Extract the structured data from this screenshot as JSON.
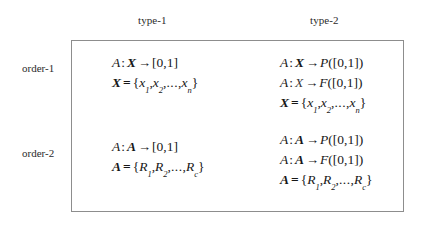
{
  "figure": {
    "type": "matrix-table",
    "columns": [
      {
        "id": "type-1",
        "label": "type-1"
      },
      {
        "id": "type-2",
        "label": "type-2"
      }
    ],
    "rows": [
      {
        "id": "order-1",
        "label": "order-1"
      },
      {
        "id": "order-2",
        "label": "order-2"
      }
    ],
    "border_color": "#8d8d8d",
    "text_color": "#171717",
    "background": "#ffffff"
  },
  "symbols": {
    "colon": ":",
    "arrow": "→",
    "equals": "=",
    "open_brace": "{",
    "close_brace": "}",
    "ellipsis": "...",
    "comma": ",",
    "unit_interval": "[0,1]"
  },
  "cells": {
    "type1_order1": {
      "lines": [
        {
          "id": "map-A-X-unit",
          "text": "A : X → [0,1]",
          "parts": [
            {
              "kind": "var-italic",
              "text": "A"
            },
            {
              "kind": "colon",
              "text": ":"
            },
            {
              "kind": "var-bold-italic",
              "text": "X"
            },
            {
              "kind": "arrow",
              "text": "→"
            },
            {
              "kind": "roman",
              "text": "[0,1]"
            }
          ]
        },
        {
          "id": "set-X",
          "text": "X = {x1, x2, ..., xn}",
          "parts": [
            {
              "kind": "var-bold-italic",
              "text": "X"
            },
            {
              "kind": "equals",
              "text": "="
            },
            {
              "kind": "brace",
              "text": "{"
            },
            {
              "kind": "var-italic-sub",
              "text": "x",
              "sub": "1"
            },
            {
              "kind": "comma",
              "text": ","
            },
            {
              "kind": "var-italic-sub",
              "text": "x",
              "sub": "2"
            },
            {
              "kind": "comma",
              "text": ","
            },
            {
              "kind": "dots",
              "text": "..."
            },
            {
              "kind": "comma",
              "text": ","
            },
            {
              "kind": "var-italic-sub",
              "text": "x",
              "sub": "n"
            },
            {
              "kind": "brace",
              "text": "}"
            }
          ]
        }
      ]
    },
    "type2_order1": {
      "lines": [
        {
          "id": "map-A-X-P-unit",
          "text": "A : X → P([0,1])",
          "parts": [
            {
              "kind": "var-italic",
              "text": "A"
            },
            {
              "kind": "colon",
              "text": ":"
            },
            {
              "kind": "var-bold-italic",
              "text": "X"
            },
            {
              "kind": "arrow",
              "text": "→"
            },
            {
              "kind": "var-italic",
              "text": "P"
            },
            {
              "kind": "roman",
              "text": "([0,1])"
            }
          ]
        },
        {
          "id": "map-A-X-F-unit",
          "text": "A : X → F([0,1])",
          "parts": [
            {
              "kind": "var-italic",
              "text": "A"
            },
            {
              "kind": "colon",
              "text": ":"
            },
            {
              "kind": "var-italic-light",
              "text": "X"
            },
            {
              "kind": "arrow",
              "text": "→"
            },
            {
              "kind": "var-italic",
              "text": "F"
            },
            {
              "kind": "roman",
              "text": "([0,1])"
            }
          ]
        },
        {
          "id": "set-X",
          "text": "X = {x1, x2, ..., xn}",
          "parts": [
            {
              "kind": "var-bold-italic",
              "text": "X"
            },
            {
              "kind": "equals",
              "text": "="
            },
            {
              "kind": "brace",
              "text": "{"
            },
            {
              "kind": "var-italic-sub",
              "text": "x",
              "sub": "1"
            },
            {
              "kind": "comma",
              "text": ","
            },
            {
              "kind": "var-italic-sub",
              "text": "x",
              "sub": "2"
            },
            {
              "kind": "comma",
              "text": ","
            },
            {
              "kind": "dots",
              "text": "..."
            },
            {
              "kind": "comma",
              "text": ","
            },
            {
              "kind": "var-italic-sub",
              "text": "x",
              "sub": "n"
            },
            {
              "kind": "brace",
              "text": "}"
            }
          ]
        }
      ]
    },
    "type1_order2": {
      "lines": [
        {
          "id": "map-A-A-unit",
          "text": "A : A → [0,1]",
          "parts": [
            {
              "kind": "var-italic",
              "text": "A"
            },
            {
              "kind": "colon",
              "text": ":"
            },
            {
              "kind": "var-bold-italic",
              "text": "A"
            },
            {
              "kind": "arrow",
              "text": "→"
            },
            {
              "kind": "roman",
              "text": "[0,1]"
            }
          ]
        },
        {
          "id": "set-A",
          "text": "A = {R1, R2, ..., Rc}",
          "parts": [
            {
              "kind": "var-bold-italic",
              "text": "A"
            },
            {
              "kind": "equals",
              "text": "="
            },
            {
              "kind": "brace",
              "text": "{"
            },
            {
              "kind": "var-italic-sub",
              "text": "R",
              "sub": "1"
            },
            {
              "kind": "comma",
              "text": ","
            },
            {
              "kind": "var-italic-sub",
              "text": "R",
              "sub": "2"
            },
            {
              "kind": "comma",
              "text": ","
            },
            {
              "kind": "dots",
              "text": "..."
            },
            {
              "kind": "comma",
              "text": ","
            },
            {
              "kind": "var-italic-sub",
              "text": "R",
              "sub": "c"
            },
            {
              "kind": "brace",
              "text": "}"
            }
          ]
        }
      ]
    },
    "type2_order2": {
      "lines": [
        {
          "id": "map-A-A-P-unit",
          "text": "A : A → P([0,1])",
          "parts": [
            {
              "kind": "var-italic",
              "text": "A"
            },
            {
              "kind": "colon",
              "text": ":"
            },
            {
              "kind": "var-bold-italic",
              "text": "A"
            },
            {
              "kind": "arrow",
              "text": "→"
            },
            {
              "kind": "var-italic",
              "text": "P"
            },
            {
              "kind": "roman",
              "text": "([0,1])"
            }
          ]
        },
        {
          "id": "map-A-A-F-unit",
          "text": "A : A → F([0,1])",
          "parts": [
            {
              "kind": "var-italic",
              "text": "A"
            },
            {
              "kind": "colon",
              "text": ":"
            },
            {
              "kind": "var-bold-italic",
              "text": "A"
            },
            {
              "kind": "arrow",
              "text": "→"
            },
            {
              "kind": "var-italic",
              "text": "F"
            },
            {
              "kind": "roman",
              "text": "([0,1])"
            }
          ]
        },
        {
          "id": "set-A",
          "text": "A = {R1, R2, ..., Rc}",
          "parts": [
            {
              "kind": "var-bold-italic",
              "text": "A"
            },
            {
              "kind": "equals",
              "text": "="
            },
            {
              "kind": "brace",
              "text": "{"
            },
            {
              "kind": "var-italic-sub",
              "text": "R",
              "sub": "1"
            },
            {
              "kind": "comma",
              "text": ","
            },
            {
              "kind": "var-italic-sub",
              "text": "R",
              "sub": "2"
            },
            {
              "kind": "comma",
              "text": ","
            },
            {
              "kind": "dots",
              "text": "..."
            },
            {
              "kind": "comma",
              "text": ","
            },
            {
              "kind": "var-italic-sub",
              "text": "R",
              "sub": "c"
            },
            {
              "kind": "brace",
              "text": "}"
            }
          ]
        }
      ]
    }
  }
}
